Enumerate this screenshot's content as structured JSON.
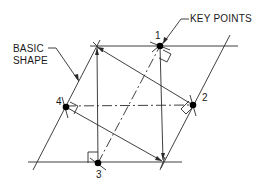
{
  "diagram": {
    "labels": {
      "basic_shape_line1": "BASIC",
      "basic_shape_line2": "SHAPE",
      "key_points": "KEY POINTS"
    },
    "key_points": [
      {
        "id": "1",
        "label": "1",
        "x": 160,
        "y": 46
      },
      {
        "id": "2",
        "label": "2",
        "x": 193,
        "y": 105
      },
      {
        "id": "3",
        "label": "3",
        "x": 98,
        "y": 163
      },
      {
        "id": "4",
        "label": "4",
        "x": 66,
        "y": 107
      }
    ],
    "colors": {
      "line": "#2a2a2a",
      "point": "#000000",
      "background": "#ffffff"
    }
  }
}
